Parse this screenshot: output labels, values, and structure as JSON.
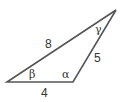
{
  "diagram": {
    "type": "triangle",
    "stroke_color": "#555555",
    "vertices": {
      "left": [
        7,
        82
      ],
      "bottom_right": [
        73,
        82
      ],
      "top": [
        116,
        10
      ]
    },
    "sides": {
      "top_left": "8",
      "right": "5",
      "bottom": "4"
    },
    "angles": {
      "left": "β",
      "bottom_right": "α",
      "top": "γ"
    }
  }
}
